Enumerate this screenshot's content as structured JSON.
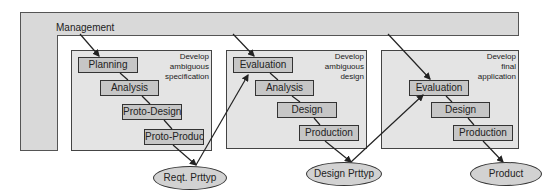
{
  "management": {
    "label": "Management"
  },
  "phases": [
    {
      "title_lines": [
        "Develop",
        "ambiguous",
        "specification"
      ],
      "steps": [
        "Planning",
        "Analysis",
        "Proto-Design",
        "Proto-Produc"
      ]
    },
    {
      "title_lines": [
        "Develop",
        "ambiguous",
        "design"
      ],
      "steps": [
        "Evaluation",
        "Analysis",
        "Design",
        "Production"
      ]
    },
    {
      "title_lines": [
        "Develop",
        "final",
        "application"
      ],
      "steps": [
        "Evaluation",
        "Design",
        "Production"
      ]
    }
  ],
  "outputs": [
    "Reqt. Prttyp",
    "Design Prttyp",
    "Product"
  ],
  "colors": {
    "management_fill": "#d9d9d9",
    "phase_fill": "#e4e4e4",
    "step_fill": "#c6c6c6",
    "line": "#222222"
  }
}
